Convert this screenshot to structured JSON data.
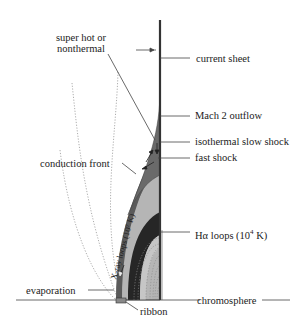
{
  "diagram": {
    "type": "solar flare reconnection model (cross-section)",
    "labels": {
      "super_hot": "super hot or",
      "super_hot_2": "nonthermal",
      "current_sheet": "current sheet",
      "mach2": "Mach 2 outflow",
      "slow_shock": "isothermal slow shock",
      "fast_shock": "fast shock",
      "conduction_front": "conduction front",
      "xray_loops": "X-ray loops (10⁷ K)",
      "halpha_loops_prefix": "Hα loops (10",
      "halpha_exp": "4",
      "halpha_suffix": " K)",
      "evaporation": "evaporation",
      "ribbon": "ribbon",
      "chromosphere": "chromosphere"
    },
    "colors": {
      "dark_region": "#333333",
      "mid_region": "#6e6e6e",
      "light_region": "#b8b8b8",
      "lines": "#444444",
      "dotted": "#888888"
    }
  }
}
